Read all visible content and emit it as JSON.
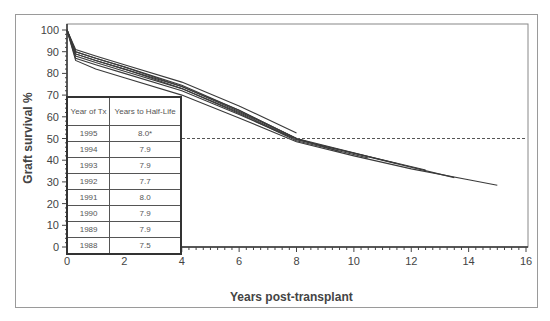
{
  "chart_data": {
    "type": "line",
    "title": "",
    "xlabel": "Years post-transplant",
    "ylabel": "Graft survival %",
    "xlim": [
      0,
      16
    ],
    "ylim": [
      0,
      100
    ],
    "x_ticks": [
      0,
      2,
      4,
      6,
      8,
      10,
      12,
      14,
      16
    ],
    "y_ticks": [
      0,
      10,
      20,
      30,
      40,
      50,
      60,
      70,
      80,
      90,
      100
    ],
    "reference_line": {
      "y": 50,
      "style": "dashed",
      "label": "Half-life threshold"
    },
    "legend_table": {
      "headers": [
        "Year of Tx",
        "Years to Half-Life"
      ],
      "rows": [
        [
          "1995",
          "8.0*"
        ],
        [
          "1994",
          "7.9"
        ],
        [
          "1993",
          "7.9"
        ],
        [
          "1992",
          "7.7"
        ],
        [
          "1991",
          "8.0"
        ],
        [
          "1990",
          "7.9"
        ],
        [
          "1989",
          "7.9"
        ],
        [
          "1988",
          "7.5"
        ]
      ]
    },
    "series": [
      {
        "name": "1995",
        "x": [
          0,
          0.3,
          1,
          2,
          4,
          6,
          8
        ],
        "values": [
          100,
          91,
          88,
          84,
          76,
          65,
          52.5
        ]
      },
      {
        "name": "1994",
        "x": [
          0,
          0.3,
          1,
          2,
          4,
          6,
          8,
          8.5
        ],
        "values": [
          100,
          90,
          87,
          83,
          74.5,
          63,
          50,
          48
        ]
      },
      {
        "name": "1993",
        "x": [
          0,
          0.3,
          1,
          2,
          4,
          6,
          8,
          9.5
        ],
        "values": [
          100,
          90,
          87,
          83,
          74,
          62.5,
          50,
          44
        ]
      },
      {
        "name": "1992",
        "x": [
          0,
          0.3,
          1,
          2,
          4,
          6,
          8,
          10.5
        ],
        "values": [
          100,
          89,
          86,
          82,
          73,
          61.5,
          49,
          41
        ]
      },
      {
        "name": "1991",
        "x": [
          0,
          0.3,
          1,
          2,
          4,
          6,
          8,
          11.5
        ],
        "values": [
          100,
          89,
          86,
          82,
          74,
          63,
          50,
          38.5
        ]
      },
      {
        "name": "1990",
        "x": [
          0,
          0.3,
          1,
          2,
          4,
          6,
          8,
          12.5
        ],
        "values": [
          100,
          88,
          85,
          81,
          73,
          62,
          49.5,
          35.5
        ]
      },
      {
        "name": "1989",
        "x": [
          0,
          0.3,
          1,
          2,
          4,
          6,
          8,
          13.5
        ],
        "values": [
          100,
          87,
          84,
          80,
          72,
          61,
          49.5,
          32
        ]
      },
      {
        "name": "1988",
        "x": [
          0,
          0.3,
          1,
          2,
          4,
          6,
          8,
          10,
          12,
          14,
          15
        ],
        "values": [
          100,
          86,
          82,
          78,
          70,
          59.5,
          48.5,
          42,
          36,
          31,
          28.5
        ]
      }
    ]
  },
  "labels": {
    "ylabel": "Graft survival %",
    "xlabel": "Years post-transplant",
    "table_header_year": "Year of Tx",
    "table_header_half": "Years to Half-Life"
  }
}
